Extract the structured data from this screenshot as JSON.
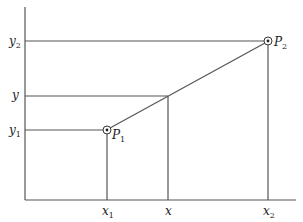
{
  "diagram": {
    "type": "linear-interpolation",
    "axes": {
      "color": "#555555"
    },
    "points": [
      {
        "name": "P",
        "sub": "1",
        "x_label": "x",
        "x_sub": "1",
        "y_label": "y",
        "y_sub": "1"
      },
      {
        "name": "P",
        "sub": "2",
        "x_label": "x",
        "x_sub": "2",
        "y_label": "y",
        "y_sub": "2"
      }
    ],
    "interpolated": {
      "x_label": "x",
      "y_label": "y"
    }
  }
}
